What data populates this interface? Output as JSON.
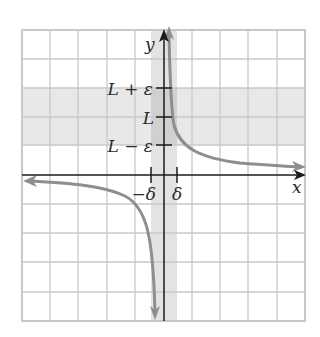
{
  "figure": {
    "axes": {
      "x_label": "x",
      "y_label": "y"
    },
    "y_ticks": {
      "upper": "L + ε",
      "middle": "L",
      "lower": "L − ε"
    },
    "x_ticks": {
      "left": "−δ",
      "right": "δ"
    },
    "colors": {
      "grid": "#c8c8c8",
      "border": "#c8c8c8",
      "band": "#e6e6e6",
      "band_overlap": "#cfcfcf",
      "curve": "#8e8e8e",
      "axis": "#1a1a1a",
      "label": "#2a2a2a"
    }
  }
}
